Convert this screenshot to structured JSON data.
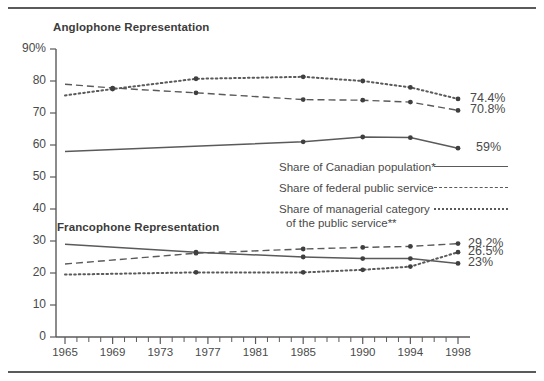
{
  "figure": {
    "sections": {
      "anglophone_title": "Anglophone Representation",
      "francophone_title": "Francophone Representation"
    }
  },
  "legend": {
    "items": [
      {
        "label": "Share of Canadian population*",
        "style": "solid"
      },
      {
        "label": "Share of federal public service",
        "style": "dashed"
      },
      {
        "label": "Share of managerial category",
        "label2": "of the public service**",
        "style": "dotted"
      }
    ]
  },
  "colors": {
    "line": "#5a5a5a",
    "text": "#4a4a4a",
    "title": "#3c3c3c",
    "rule": "#5a5a5a"
  },
  "chart_data": {
    "type": "line",
    "title": "",
    "xlabel": "",
    "ylabel": "",
    "ylim": [
      0,
      90
    ],
    "xlim": [
      1965,
      1998
    ],
    "grid": false,
    "legend_position": "center",
    "y_ticks": [
      0,
      10,
      20,
      30,
      40,
      50,
      60,
      70,
      80,
      90
    ],
    "y_tick_labels": [
      "0",
      "10",
      "20",
      "30",
      "40",
      "50",
      "60",
      "70",
      "80",
      "90%"
    ],
    "x_ticks": [
      1965,
      1969,
      1973,
      1977,
      1981,
      1985,
      1990,
      1994,
      1998
    ],
    "x_tick_labels": [
      "1965",
      "1969",
      "1973",
      "1977",
      "1981",
      "1985",
      "1990",
      "1994",
      "1998"
    ],
    "x_minor_ticks": true,
    "groups": [
      {
        "name": "Anglophone Representation",
        "series": [
          {
            "name": "Share of Canadian population*",
            "style": "solid",
            "x": [
              1965,
              1985,
              1990,
              1994,
              1998
            ],
            "values": [
              58.0,
              61.0,
              62.5,
              62.3,
              59.0
            ],
            "end_label": "59%"
          },
          {
            "name": "Share of federal public service",
            "style": "dashed",
            "x": [
              1965,
              1969,
              1976,
              1985,
              1990,
              1994,
              1998
            ],
            "values": [
              79.0,
              77.8,
              76.3,
              74.2,
              74.0,
              73.4,
              70.8
            ],
            "end_label": "70.8%"
          },
          {
            "name": "Share of managerial category of the public service**",
            "style": "dotted",
            "x": [
              1965,
              1969,
              1976,
              1985,
              1990,
              1994,
              1998
            ],
            "values": [
              75.5,
              77.5,
              80.7,
              81.3,
              80.0,
              78.0,
              74.4
            ],
            "end_label": "74.4%"
          }
        ]
      },
      {
        "name": "Francophone Representation",
        "series": [
          {
            "name": "Share of Canadian population*",
            "style": "solid",
            "x": [
              1965,
              1976,
              1985,
              1990,
              1994,
              1998
            ],
            "values": [
              29.0,
              26.5,
              25.0,
              24.5,
              24.5,
              23.0
            ],
            "end_label": "23%"
          },
          {
            "name": "Share of federal public service",
            "style": "dashed",
            "x": [
              1965,
              1976,
              1985,
              1990,
              1994,
              1998
            ],
            "values": [
              22.8,
              26.2,
              27.5,
              28.0,
              28.3,
              29.2
            ],
            "end_label": "29.2%"
          },
          {
            "name": "Share of managerial category of the public service**",
            "style": "dotted",
            "x": [
              1965,
              1976,
              1985,
              1990,
              1994,
              1998
            ],
            "values": [
              19.5,
              20.2,
              20.2,
              21.0,
              22.0,
              26.5
            ],
            "end_label": "26.5%"
          }
        ]
      }
    ],
    "endpoint_labels": [
      {
        "text": "74.4%",
        "value": 74.4
      },
      {
        "text": "70.8%",
        "value": 70.8
      },
      {
        "text": "59%",
        "value": 59.0
      },
      {
        "text": "29.2%",
        "value": 29.2
      },
      {
        "text": "26.5%",
        "value": 26.5
      },
      {
        "text": "23%",
        "value": 23.0
      }
    ]
  }
}
